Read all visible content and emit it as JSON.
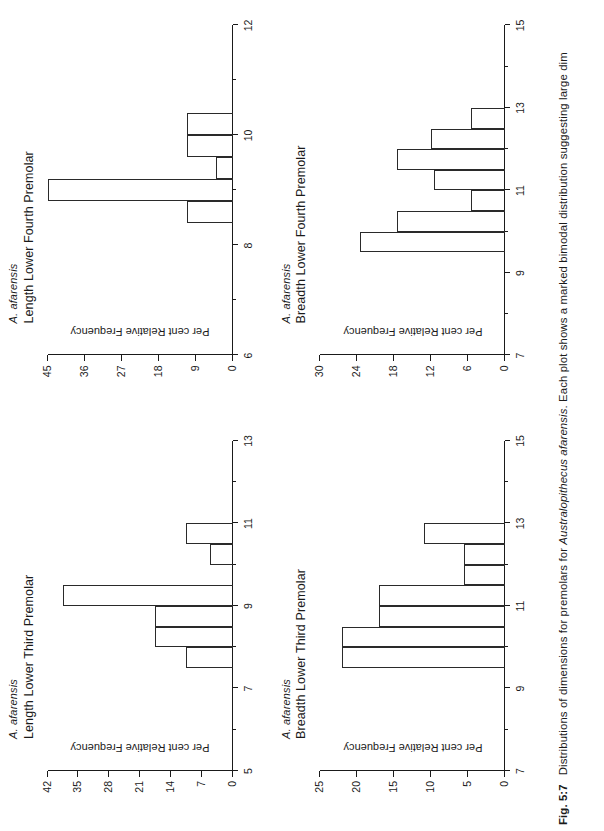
{
  "figure": {
    "caption_number": "Fig. 5:7",
    "caption_part1": "Distributions of dimensions for premolars for",
    "caption_species": "Australopithecus afarensis",
    "caption_part2": ". Each plot shows a marked bimodal distribution suggesting large dim"
  },
  "common": {
    "species": "A. afarensis",
    "ylabel": "Per cent Relative Frequency"
  },
  "chart_data": [
    {
      "id": "length-lower-third-premolar",
      "type": "bar",
      "title": "Length Lower Third Premolar",
      "subtitle": "A. afarensis",
      "xlabel": "",
      "ylabel": "Per cent Relative Frequency",
      "xlim": [
        5,
        13
      ],
      "ylim": [
        0,
        42
      ],
      "xticks": [
        5,
        7,
        9,
        11,
        13
      ],
      "xticks_minor": [
        6,
        8,
        10,
        12
      ],
      "yticks": [
        0,
        7,
        14,
        21,
        28,
        35,
        42
      ],
      "grid": false,
      "legend": "none",
      "bin_width": 0.5,
      "bins": [
        {
          "x0": 7.5,
          "x1": 8.0,
          "value": 10.5
        },
        {
          "x0": 8.0,
          "x1": 8.5,
          "value": 17.5
        },
        {
          "x0": 8.5,
          "x1": 9.0,
          "value": 17.5
        },
        {
          "x0": 9.0,
          "x1": 9.5,
          "value": 38.5
        },
        {
          "x0": 9.5,
          "x1": 10.0,
          "value": 0
        },
        {
          "x0": 10.0,
          "x1": 10.5,
          "value": 5.0
        },
        {
          "x0": 10.5,
          "x1": 11.0,
          "value": 10.5
        }
      ]
    },
    {
      "id": "length-lower-fourth-premolar",
      "type": "bar",
      "title": "Length Lower Fourth Premolar",
      "subtitle": "A. afarensis",
      "xlabel": "",
      "ylabel": "Per cent Relative Frequency",
      "xlim": [
        6,
        12
      ],
      "ylim": [
        0,
        45
      ],
      "xticks": [
        6,
        8,
        10,
        12
      ],
      "xticks_minor": [
        7,
        9,
        11
      ],
      "yticks": [
        0,
        9,
        18,
        27,
        36,
        45
      ],
      "grid": false,
      "legend": "none",
      "bin_width": 0.4,
      "bins": [
        {
          "x0": 8.4,
          "x1": 8.8,
          "value": 11.0
        },
        {
          "x0": 8.8,
          "x1": 9.2,
          "value": 45.0
        },
        {
          "x0": 9.2,
          "x1": 9.6,
          "value": 4.0
        },
        {
          "x0": 9.6,
          "x1": 10.0,
          "value": 11.0
        },
        {
          "x0": 10.0,
          "x1": 10.4,
          "value": 11.0
        }
      ]
    },
    {
      "id": "breadth-lower-third-premolar",
      "type": "bar",
      "title": "Breadth Lower Third Premolar",
      "subtitle": "A. afarensis",
      "xlabel": "",
      "ylabel": "Per cent Relative Frequency",
      "xlim": [
        7,
        15
      ],
      "ylim": [
        0,
        25
      ],
      "xticks": [
        7,
        9,
        11,
        13,
        15
      ],
      "xticks_minor": [
        8,
        10,
        12,
        14
      ],
      "yticks": [
        0,
        5,
        10,
        15,
        20,
        25
      ],
      "grid": false,
      "legend": "none",
      "bin_width": 0.5,
      "bins": [
        {
          "x0": 9.5,
          "x1": 10.0,
          "value": 22.0
        },
        {
          "x0": 10.0,
          "x1": 10.5,
          "value": 22.0
        },
        {
          "x0": 10.5,
          "x1": 11.0,
          "value": 17.0
        },
        {
          "x0": 11.0,
          "x1": 11.5,
          "value": 17.0
        },
        {
          "x0": 11.5,
          "x1": 12.0,
          "value": 5.5
        },
        {
          "x0": 12.0,
          "x1": 12.5,
          "value": 5.5
        },
        {
          "x0": 12.5,
          "x1": 13.0,
          "value": 11.0
        }
      ]
    },
    {
      "id": "breadth-lower-fourth-premolar",
      "type": "bar",
      "title": "Breadth Lower Fourth Premolar",
      "subtitle": "A. afarensis",
      "xlabel": "",
      "ylabel": "Per cent Relative Frequency",
      "xlim": [
        7,
        15
      ],
      "ylim": [
        0,
        30
      ],
      "xticks": [
        7,
        9,
        11,
        13,
        15
      ],
      "xticks_minor": [
        8,
        10,
        12,
        14
      ],
      "yticks": [
        0,
        6,
        12,
        18,
        24,
        30
      ],
      "grid": false,
      "legend": "none",
      "bin_width": 0.5,
      "bins": [
        {
          "x0": 9.5,
          "x1": 10.0,
          "value": 23.5
        },
        {
          "x0": 10.0,
          "x1": 10.5,
          "value": 17.5
        },
        {
          "x0": 10.5,
          "x1": 11.0,
          "value": 5.5
        },
        {
          "x0": 11.0,
          "x1": 11.5,
          "value": 11.5
        },
        {
          "x0": 11.5,
          "x1": 12.0,
          "value": 17.5
        },
        {
          "x0": 12.0,
          "x1": 12.5,
          "value": 12.0
        },
        {
          "x0": 12.5,
          "x1": 13.0,
          "value": 5.5
        }
      ]
    }
  ]
}
